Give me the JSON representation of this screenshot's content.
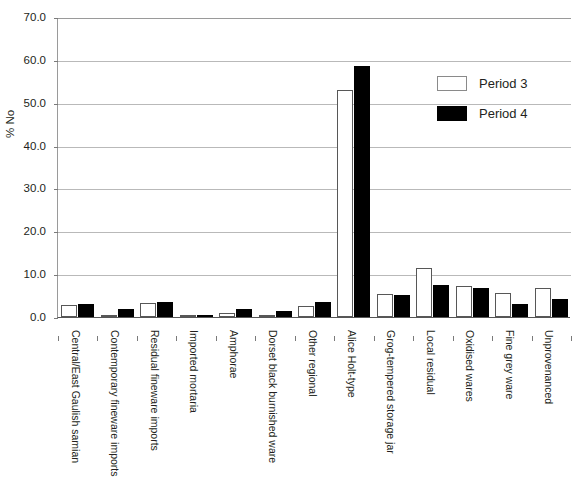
{
  "chart": {
    "y_axis_title": "% No",
    "y_ticks": [
      "0.0",
      "10.0",
      "20.0",
      "30.0",
      "40.0",
      "50.0",
      "60.0",
      "70.0"
    ],
    "legend": [
      {
        "label": "Period 3",
        "swatch": "white-square-swatch",
        "color": "#ffffff"
      },
      {
        "label": "Period 4",
        "swatch": "black-square-swatch",
        "color": "#000000"
      }
    ]
  },
  "chart_data": {
    "type": "bar",
    "title": "",
    "xlabel": "",
    "ylabel": "% No",
    "ylim": [
      0,
      70
    ],
    "yticks": [
      0,
      10,
      20,
      30,
      40,
      50,
      60,
      70
    ],
    "grid": true,
    "legend_position": "upper-right",
    "categories": [
      "Central/East Gaulish samian",
      "Contemporary fineware imports",
      "Residual fineware imports",
      "Imported mortaria",
      "Amphorae",
      "Dorset black burnished ware",
      "Other regional",
      "Alice Holt-type",
      "Grog-tempered storage jar",
      "Local residual",
      "Oxidised wares",
      "Fine grey ware",
      "Unprovenanced"
    ],
    "series": [
      {
        "name": "Period 3",
        "color": "#ffffff",
        "values": [
          2.8,
          0.3,
          3.2,
          0.3,
          1.0,
          0.5,
          2.5,
          53.0,
          5.3,
          11.5,
          7.3,
          5.5,
          6.8
        ]
      },
      {
        "name": "Period 4",
        "color": "#000000",
        "values": [
          3.0,
          1.8,
          3.6,
          0.2,
          1.9,
          1.5,
          3.6,
          58.5,
          5.2,
          7.5,
          6.7,
          3.0,
          4.3
        ]
      }
    ]
  }
}
